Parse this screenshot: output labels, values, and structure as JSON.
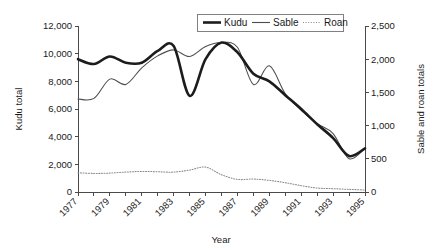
{
  "chart_data": {
    "type": "line",
    "title": "",
    "xlabel": "Year",
    "ylabel": "Kudu total",
    "y2label": "Sable and roan totals",
    "x": [
      1977,
      1978,
      1979,
      1980,
      1981,
      1982,
      1983,
      1984,
      1985,
      1986,
      1987,
      1988,
      1989,
      1990,
      1991,
      1992,
      1993,
      1994,
      1995
    ],
    "xlim": [
      1977,
      1995
    ],
    "ylim": [
      0,
      12000
    ],
    "y2lim": [
      0,
      2500
    ],
    "grid": false,
    "legend_position": "top-center",
    "xtick_labels": [
      "1977",
      "1979",
      "1981",
      "1983",
      "1985",
      "1987",
      "1989",
      "1991",
      "1993",
      "1995"
    ],
    "xtick_values": [
      1977,
      1979,
      1981,
      1983,
      1985,
      1987,
      1989,
      1991,
      1993,
      1995
    ],
    "ytick_labels": [
      "0",
      "2,000",
      "4,000",
      "6,000",
      "8,000",
      "10,000",
      "12,000"
    ],
    "ytick_values": [
      0,
      2000,
      4000,
      6000,
      8000,
      10000,
      12000
    ],
    "y2tick_labels": [
      "0",
      "500",
      "1,000",
      "1,500",
      "2,000",
      "2,500"
    ],
    "y2tick_values": [
      0,
      500,
      1000,
      1500,
      2000,
      2500
    ],
    "series": [
      {
        "name": "Kudu",
        "axis": "left",
        "style": "thick-solid",
        "color": "#1c1c1c",
        "values": [
          9600,
          9250,
          9800,
          9350,
          9350,
          10200,
          10550,
          6950,
          9600,
          10800,
          10100,
          8550,
          8000,
          7000,
          6000,
          4900,
          3900,
          2600,
          3150
        ]
      },
      {
        "name": "Sable",
        "axis": "right",
        "style": "thin-solid",
        "color": "#4d4d4d",
        "values": [
          1400,
          1410,
          1700,
          1620,
          1870,
          2050,
          2140,
          2040,
          2190,
          2250,
          2180,
          1620,
          1900,
          1480,
          1230,
          1030,
          880,
          500,
          660
        ]
      },
      {
        "name": "Roan",
        "axis": "right",
        "style": "dotted",
        "color": "#8a8a8a",
        "values": [
          290,
          280,
          285,
          300,
          310,
          305,
          300,
          330,
          375,
          260,
          190,
          195,
          175,
          140,
          95,
          60,
          50,
          40,
          30
        ]
      }
    ]
  },
  "legend": {
    "items": [
      {
        "label": "Kudu",
        "style": "thick-solid"
      },
      {
        "label": "Sable",
        "style": "thin-solid"
      },
      {
        "label": "Roan",
        "style": "dotted"
      }
    ]
  }
}
